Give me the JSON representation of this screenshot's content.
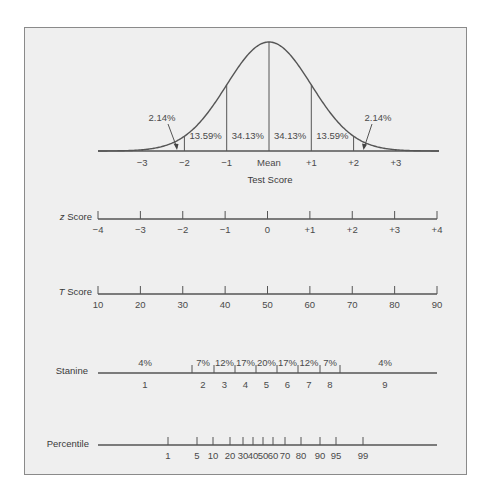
{
  "chart_data": {
    "type": "line",
    "curve": {
      "xlabel": "Test Score",
      "tick_labels": [
        "−3",
        "−2",
        "−1",
        "Mean",
        "+1",
        "+2",
        "+3"
      ],
      "sd_positions": [
        -3,
        -2,
        -1,
        0,
        1,
        2,
        3
      ],
      "area_labels": [
        {
          "range": "-3 to -2",
          "label": "2.14%"
        },
        {
          "range": "-2 to -1",
          "label": "13.59%"
        },
        {
          "range": "-1 to 0",
          "label": "34.13%"
        },
        {
          "range": "0 to +1",
          "label": "34.13%"
        },
        {
          "range": "+1 to +2",
          "label": "13.59%"
        },
        {
          "range": "+2 to +3",
          "label": "2.14%"
        }
      ]
    },
    "z_score": {
      "label_italic": "z",
      "label_rest": " Score",
      "ticks": [
        "−4",
        "−3",
        "−2",
        "−1",
        "0",
        "+1",
        "+2",
        "+3",
        "+4"
      ],
      "values": [
        -4,
        -3,
        -2,
        -1,
        0,
        1,
        2,
        3,
        4
      ]
    },
    "t_score": {
      "label_italic": "T",
      "label_rest": " Score",
      "ticks": [
        "10",
        "20",
        "30",
        "40",
        "50",
        "60",
        "70",
        "80",
        "90"
      ],
      "values": [
        10,
        20,
        30,
        40,
        50,
        60,
        70,
        80,
        90
      ]
    },
    "stanine": {
      "label": "Stanine",
      "bands": [
        {
          "stanine": "1",
          "percent": "4%"
        },
        {
          "stanine": "2",
          "percent": "7%"
        },
        {
          "stanine": "3",
          "percent": "12%"
        },
        {
          "stanine": "4",
          "percent": "17%"
        },
        {
          "stanine": "5",
          "percent": "20%"
        },
        {
          "stanine": "6",
          "percent": "17%"
        },
        {
          "stanine": "7",
          "percent": "12%"
        },
        {
          "stanine": "8",
          "percent": "7%"
        },
        {
          "stanine": "9",
          "percent": "4%"
        }
      ]
    },
    "percentile": {
      "label": "Percentile",
      "ticks": [
        "1",
        "5",
        "10",
        "20",
        "30",
        "40",
        "50",
        "60",
        "70",
        "80",
        "90",
        "95",
        "99"
      ],
      "values": [
        1,
        5,
        10,
        20,
        30,
        40,
        50,
        60,
        70,
        80,
        90,
        95,
        99
      ]
    }
  }
}
